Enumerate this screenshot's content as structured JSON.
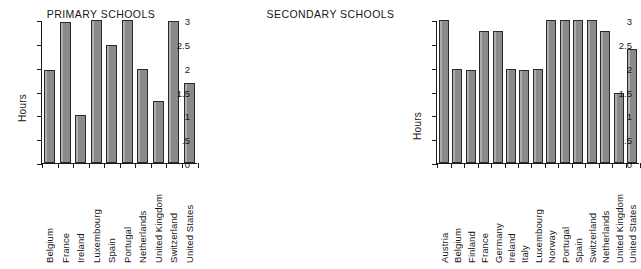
{
  "chart_data": [
    {
      "type": "bar",
      "title": "PRIMARY SCHOOLS",
      "xlabel": "",
      "ylabel": "Hours",
      "ylim": [
        0,
        3
      ],
      "yticks": [
        0,
        0.5,
        1,
        1.5,
        2,
        2.5,
        3
      ],
      "ytick_labels": [
        "0",
        ".5",
        "1",
        "1.5",
        "2",
        "2.5",
        "3"
      ],
      "grid": false,
      "legend": "none",
      "categories": [
        "Belgium",
        "France",
        "Ireland",
        "Luxembourg",
        "Spain",
        "Portugal",
        "Netherlands",
        "United Kingdom",
        "Switzerland",
        "United States"
      ],
      "values": [
        1.95,
        2.95,
        1.0,
        3.0,
        2.47,
        3.0,
        1.97,
        1.3,
        2.98,
        1.67
      ]
    },
    {
      "type": "bar",
      "title": "SECONDARY SCHOOLS",
      "xlabel": "",
      "ylabel": "Hours",
      "ylim": [
        0,
        3
      ],
      "yticks": [
        0,
        0.5,
        1,
        1.5,
        2,
        2.5,
        3
      ],
      "ytick_labels": [
        "0",
        ".5",
        "1",
        "1.5",
        "2",
        "2.5",
        "3"
      ],
      "grid": false,
      "legend": "none",
      "categories": [
        "Austria",
        "Belgium",
        "Finland",
        "France",
        "Germany",
        "Ireland",
        "Italy",
        "Luxembourg",
        "Norway",
        "Portugal",
        "Spain",
        "Switzerland",
        "Netherlands",
        "United Kingdom",
        "United States"
      ],
      "values": [
        3.0,
        1.98,
        1.96,
        2.77,
        2.77,
        1.97,
        1.96,
        1.97,
        3.0,
        3.0,
        3.0,
        3.0,
        2.78,
        1.46,
        2.39
      ]
    }
  ],
  "colors": {
    "bar_fill": "#8a8a8a",
    "bar_stroke": "#2a2a2a",
    "axis": "#1a1a1a",
    "background": "#ffffff",
    "text": "#171717"
  }
}
